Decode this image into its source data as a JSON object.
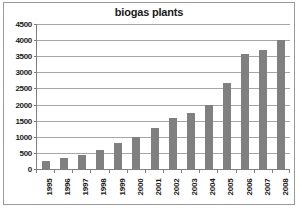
{
  "chart_data": {
    "type": "bar",
    "title": "biogas plants",
    "xlabel": "",
    "ylabel": "",
    "categories": [
      "1995",
      "1996",
      "1997",
      "1998",
      "1999",
      "2000",
      "2001",
      "2002",
      "2003",
      "2004",
      "2005",
      "2006",
      "2007",
      "2008"
    ],
    "values": [
      250,
      350,
      450,
      600,
      820,
      1000,
      1270,
      1570,
      1730,
      2000,
      2680,
      3570,
      3700,
      4000
    ],
    "ylim": [
      0,
      4500
    ],
    "ytick_step": 500,
    "yticks": [
      "4500",
      "4000",
      "3500",
      "3000",
      "2500",
      "2000",
      "1500",
      "1000",
      "500",
      "0"
    ],
    "grid": true,
    "legend": "none",
    "colors": {
      "bar": "#808080",
      "gridline": "#a6a6a6",
      "axis": "#808080",
      "border": "#9a9a9a",
      "text": "#1a1a1a",
      "background": "#ffffff"
    }
  }
}
